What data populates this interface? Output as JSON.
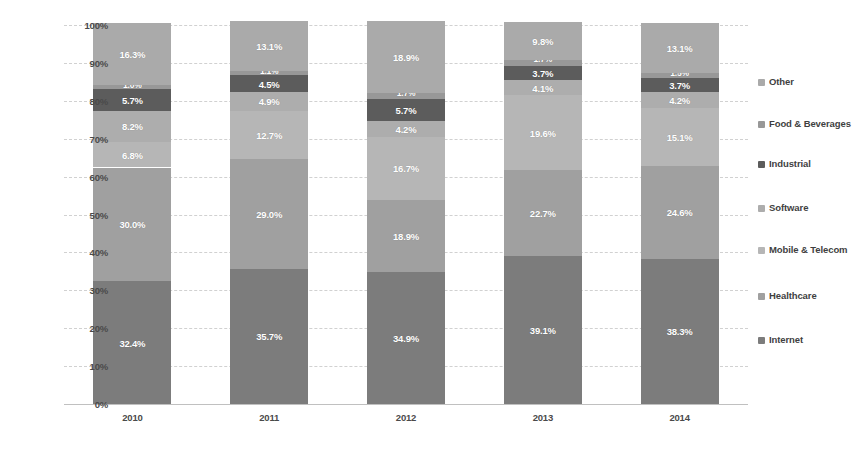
{
  "chart_data": {
    "type": "bar",
    "subtype": "stacked-percentage-column",
    "title": "",
    "subtitle": "",
    "xlabel": "",
    "ylabel": "",
    "categories": [
      "2010",
      "2011",
      "2012",
      "2013",
      "2014"
    ],
    "ylim": [
      0,
      100
    ],
    "ytick_labels": [
      "100%",
      "90%",
      "80%",
      "70%",
      "60%",
      "50%",
      "40%",
      "30%",
      "20%",
      "10%",
      "0%"
    ],
    "ytick_values": [
      100,
      90,
      80,
      70,
      60,
      50,
      40,
      30,
      20,
      10,
      0
    ],
    "grid": true,
    "legend_position": "right",
    "stack_order_bottom_to_top": [
      "Internet",
      "Healthcare",
      "Mobile & Telecom",
      "Software",
      "Industrial",
      "Food & Beverages",
      "Other"
    ],
    "series": [
      {
        "name": "Internet",
        "color": "#7c7c7c",
        "values": [
          32.4,
          35.7,
          34.9,
          39.1,
          38.3
        ],
        "labels": [
          "32.4%",
          "35.7%",
          "34.9%",
          "39.1%",
          "38.3%"
        ]
      },
      {
        "name": "Healthcare",
        "color": "#a0a0a0",
        "values": [
          30.0,
          29.0,
          18.9,
          22.7,
          24.6
        ],
        "labels": [
          "30.0%",
          "29.0%",
          "18.9%",
          "22.7%",
          "24.6%"
        ]
      },
      {
        "name": "Mobile & Telecom",
        "color": "#b6b6b6",
        "values": [
          6.8,
          12.7,
          16.7,
          19.6,
          15.1
        ],
        "labels": [
          "6.8%",
          "12.7%",
          "16.7%",
          "19.6%",
          "15.1%"
        ]
      },
      {
        "name": "Software",
        "color": "#adadad",
        "values": [
          8.2,
          4.9,
          4.2,
          4.1,
          4.2
        ],
        "labels": [
          "8.2%",
          "4.9%",
          "4.2%",
          "4.1%",
          "4.2%"
        ]
      },
      {
        "name": "Industrial",
        "color": "#5c5c5c",
        "values": [
          5.7,
          4.5,
          5.7,
          3.7,
          3.7
        ],
        "labels": [
          "5.7%",
          "4.5%",
          "5.7%",
          "3.7%",
          "3.7%"
        ]
      },
      {
        "name": "Food & Beverages",
        "color": "#989898",
        "values": [
          1.0,
          1.1,
          1.7,
          1.7,
          1.5
        ],
        "labels": [
          "1.0%",
          "1.1%",
          "1.7%",
          "1.7%",
          "1.5%"
        ]
      },
      {
        "name": "Other",
        "color": "#aaaaaa",
        "values": [
          16.3,
          13.1,
          18.9,
          9.8,
          13.1
        ],
        "labels": [
          "16.3%",
          "13.1%",
          "18.9%",
          "9.8%",
          "13.1%"
        ]
      }
    ]
  },
  "legend": {
    "items": [
      {
        "label": "Other",
        "color": "#aaaaaa",
        "top": 14
      },
      {
        "label": "Food & Beverages",
        "color": "#989898",
        "top": 56
      },
      {
        "label": "Industrial",
        "color": "#5c5c5c",
        "top": 96
      },
      {
        "label": "Software",
        "color": "#adadad",
        "top": 140
      },
      {
        "label": "Mobile & Telecom",
        "color": "#b6b6b6",
        "top": 182
      },
      {
        "label": "Healthcare",
        "color": "#a0a0a0",
        "top": 228
      },
      {
        "label": "Internet",
        "color": "#7c7c7c",
        "top": 272
      }
    ]
  }
}
